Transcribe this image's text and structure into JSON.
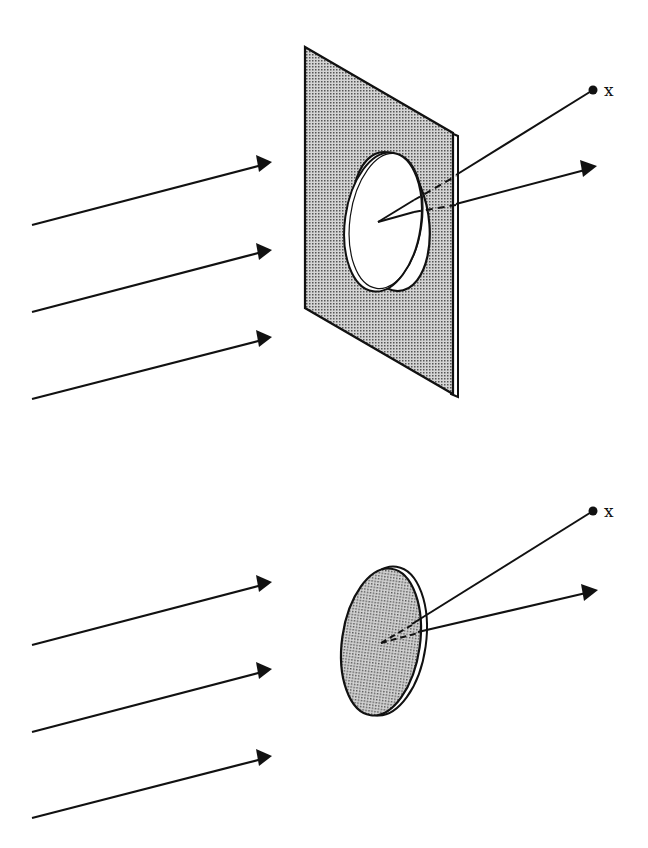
{
  "figure": {
    "top_panel": {
      "description": "Plane wave incident on opaque screen with circular aperture",
      "point_label": "x"
    },
    "bottom_panel": {
      "description": "Plane wave incident on complementary opaque disc",
      "point_label": "x"
    }
  },
  "colors": {
    "ink": "#111111",
    "shading": "#9a9a9a",
    "background": "#ffffff"
  }
}
